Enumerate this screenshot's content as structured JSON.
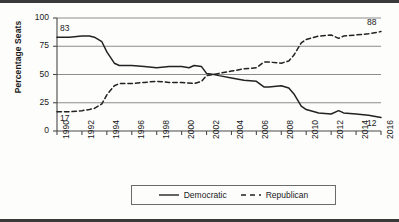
{
  "figure": {
    "background": "#fdfdfc",
    "rule_color": "#3a3a3a"
  },
  "axis": {
    "y_title": "Percentage Seats",
    "y_ticks": [
      "0",
      "25",
      "50",
      "75",
      "100"
    ],
    "x_ticks": [
      "1990",
      "1992",
      "1994",
      "1996",
      "1998",
      "2000",
      "2002",
      "2004",
      "2006",
      "2008",
      "2010",
      "2012",
      "2014",
      "2016"
    ]
  },
  "annotations": {
    "dem_start": "83",
    "dem_end": "12",
    "rep_start": "17",
    "rep_end": "88"
  },
  "legend": {
    "items": [
      {
        "label": "Democratic",
        "style": "solid",
        "color": "#222222"
      },
      {
        "label": "Republican",
        "style": "dashed",
        "color": "#222222"
      }
    ]
  },
  "chart_data": {
    "type": "line",
    "title": "",
    "xlabel": "",
    "ylabel": "Percentage Seats",
    "xlim": [
      1990,
      2016
    ],
    "ylim": [
      0,
      100
    ],
    "yticks": [
      0,
      25,
      50,
      75,
      100
    ],
    "xticks": [
      1990,
      1992,
      1994,
      1996,
      1998,
      2000,
      2002,
      2004,
      2006,
      2008,
      2010,
      2012,
      2014,
      2016
    ],
    "grid": "horizontal",
    "legend_position": "below-center",
    "x": [
      1990,
      1991,
      1992,
      1993,
      1994,
      1995,
      1996,
      1997,
      1998,
      1999,
      2000,
      2001,
      2002,
      2003,
      2004,
      2005,
      2006,
      2007,
      2008,
      2009,
      2010,
      2011,
      2012,
      2013,
      2014,
      2015,
      2016
    ],
    "series": [
      {
        "name": "Democratic",
        "style": "solid",
        "color": "#222222",
        "values": [
          83,
          83,
          84,
          83,
          80,
          62,
          58,
          57,
          57,
          56,
          57,
          56,
          54,
          51,
          50,
          48,
          46,
          45,
          45,
          38,
          37,
          35,
          36,
          20,
          18,
          17,
          12
        ],
        "start_label": 83,
        "end_label": 12
      },
      {
        "name": "Republican",
        "style": "dashed",
        "color": "#222222",
        "values": [
          17,
          17,
          18,
          19,
          20,
          38,
          42,
          43,
          43,
          44,
          43,
          44,
          46,
          49,
          50,
          52,
          54,
          55,
          55,
          62,
          62,
          64,
          63,
          80,
          82,
          83,
          88
        ],
        "start_label": 17,
        "end_label": 88
      }
    ],
    "series_plot_points": {
      "Democratic": [
        [
          1990,
          83
        ],
        [
          1991,
          83
        ],
        [
          1992,
          84
        ],
        [
          1992.6,
          84
        ],
        [
          1993,
          83
        ],
        [
          1993.6,
          79
        ],
        [
          1994,
          70
        ],
        [
          1994.6,
          60
        ],
        [
          1995,
          58
        ],
        [
          1996,
          58
        ],
        [
          1997,
          57
        ],
        [
          1998,
          56
        ],
        [
          1999,
          57
        ],
        [
          2000,
          57
        ],
        [
          2000.6,
          56
        ],
        [
          2001,
          58
        ],
        [
          2001.6,
          57
        ],
        [
          2002,
          51
        ],
        [
          2002.6,
          50
        ],
        [
          2003,
          49
        ],
        [
          2004,
          47
        ],
        [
          2005,
          45
        ],
        [
          2006,
          44
        ],
        [
          2006.6,
          39
        ],
        [
          2007,
          39
        ],
        [
          2008,
          40
        ],
        [
          2008.6,
          38
        ],
        [
          2009,
          33
        ],
        [
          2009.6,
          22
        ],
        [
          2010,
          19
        ],
        [
          2011,
          16
        ],
        [
          2012,
          15
        ],
        [
          2012.6,
          18
        ],
        [
          2013,
          16
        ],
        [
          2014,
          15
        ],
        [
          2015,
          14
        ],
        [
          2016,
          12
        ]
      ],
      "Republican": [
        [
          1990,
          17
        ],
        [
          1991,
          17
        ],
        [
          1992,
          18
        ],
        [
          1992.6,
          19
        ],
        [
          1993,
          20
        ],
        [
          1993.6,
          24
        ],
        [
          1994,
          32
        ],
        [
          1994.6,
          40
        ],
        [
          1995,
          42
        ],
        [
          1996,
          42
        ],
        [
          1997,
          43
        ],
        [
          1998,
          44
        ],
        [
          1999,
          43
        ],
        [
          2000,
          43
        ],
        [
          2001,
          42
        ],
        [
          2001.6,
          44
        ],
        [
          2002,
          49
        ],
        [
          2002.6,
          50
        ],
        [
          2003,
          51
        ],
        [
          2004,
          53
        ],
        [
          2005,
          55
        ],
        [
          2006,
          56
        ],
        [
          2006.6,
          61
        ],
        [
          2007,
          61
        ],
        [
          2008,
          60
        ],
        [
          2008.6,
          62
        ],
        [
          2009,
          67
        ],
        [
          2009.6,
          78
        ],
        [
          2010,
          81
        ],
        [
          2011,
          84
        ],
        [
          2012,
          85
        ],
        [
          2012.6,
          82
        ],
        [
          2013,
          84
        ],
        [
          2014,
          85
        ],
        [
          2015,
          86
        ],
        [
          2016,
          88
        ]
      ]
    }
  }
}
